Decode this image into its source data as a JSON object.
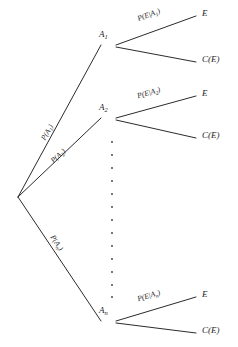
{
  "diagram": {
    "background_color": "#ffffff",
    "line_color": "#2b2b2b",
    "text_color": "#1d1d1d",
    "root": {
      "label": ""
    },
    "branches": [
      {
        "node_label": "A",
        "node_subscript": "1",
        "prior_label": "P(A",
        "prior_subscript": "1",
        "prior_label_end": ")",
        "conditional_label": "P(E|A",
        "conditional_subscript": "1",
        "conditional_label_end": ")",
        "outcome_event": "E",
        "outcome_complement": "C(E)"
      },
      {
        "node_label": "A",
        "node_subscript": "2",
        "prior_label": "P(A",
        "prior_subscript": "2",
        "prior_label_end": ")",
        "conditional_label": "P(E|A",
        "conditional_subscript": "2",
        "conditional_label_end": ")",
        "outcome_event": "E",
        "outcome_complement": "C(E)"
      },
      {
        "node_label": "A",
        "node_subscript": "n",
        "prior_label": "P(A",
        "prior_subscript": "n",
        "prior_label_end": ")",
        "conditional_label": "P(E|A",
        "conditional_subscript": "n",
        "conditional_label_end": ")",
        "outcome_event": "E",
        "outcome_complement": "C(E)"
      }
    ],
    "ellipsis": {
      "symbol": "·",
      "count": 13
    }
  }
}
